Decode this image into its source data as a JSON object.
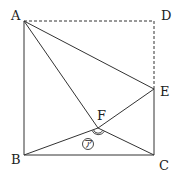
{
  "diagram": {
    "type": "geometry",
    "points": {
      "A": {
        "label": "A",
        "x": 24,
        "y": 21
      },
      "D": {
        "label": "D",
        "x": 154,
        "y": 21
      },
      "E": {
        "label": "E",
        "x": 154,
        "y": 89
      },
      "C": {
        "label": "C",
        "x": 154,
        "y": 155
      },
      "B": {
        "label": "B",
        "x": 24,
        "y": 155
      },
      "F": {
        "label": "F",
        "x": 98,
        "y": 128
      }
    },
    "solid_segments": [
      "AB",
      "BC",
      "CE",
      "AE",
      "AF",
      "FE",
      "BF",
      "FC"
    ],
    "dashed_segments": [
      "AD",
      "DE"
    ],
    "angle_mark": {
      "vertex": "F",
      "between": [
        "B",
        "C"
      ],
      "label": "ア",
      "arcs": 2
    },
    "stroke_color": "#333333"
  }
}
